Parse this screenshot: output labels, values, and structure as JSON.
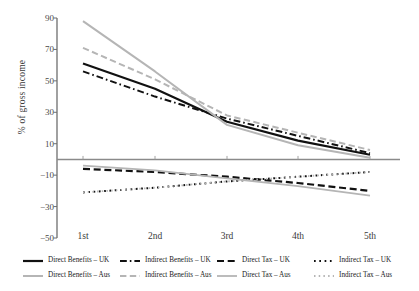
{
  "chart_data": {
    "type": "line",
    "title": "",
    "xlabel": "",
    "ylabel": "% of gross income",
    "categories": [
      "1st",
      "2nd",
      "3rd",
      "4th",
      "5th"
    ],
    "ylim": [
      -50,
      90
    ],
    "yticks": [
      90,
      70,
      50,
      30,
      10,
      -10,
      -30,
      -50
    ],
    "ytick_labels": [
      "90",
      "70",
      "50",
      "30",
      "10",
      "−10",
      "−30",
      "−50"
    ],
    "grid": false,
    "legend_position": "bottom",
    "zero_line": 0,
    "series": [
      {
        "name": "Direct Benefits – UK",
        "color": "#111111",
        "style": "solid",
        "width": 2.2,
        "values": [
          61,
          45,
          24,
          12,
          3
        ]
      },
      {
        "name": "Indirect Benefits – UK",
        "color": "#111111",
        "style": "dashdot",
        "width": 2.0,
        "values": [
          56,
          40,
          26,
          15,
          4
        ]
      },
      {
        "name": "Direct Tax – UK",
        "color": "#111111",
        "style": "dashed",
        "width": 2.2,
        "values": [
          -6,
          -8,
          -11,
          -15,
          -20
        ]
      },
      {
        "name": "Indirect Tax – UK",
        "color": "#111111",
        "style": "dotted",
        "width": 2.0,
        "values": [
          -21,
          -18,
          -14,
          -11,
          -8
        ]
      },
      {
        "name": "Direct Benefits – Aus",
        "color": "#b5b5b5",
        "style": "solid",
        "width": 2.0,
        "values": [
          88,
          56,
          22,
          9,
          1
        ]
      },
      {
        "name": "Indirect Benefits – Aus",
        "color": "#b5b5b5",
        "style": "dashed",
        "width": 2.0,
        "values": [
          71,
          51,
          28,
          17,
          6
        ]
      },
      {
        "name": "Direct Tax – Aus",
        "color": "#b5b5b5",
        "style": "solid",
        "width": 1.8,
        "values": [
          -4,
          -7,
          -12,
          -17,
          -23
        ]
      },
      {
        "name": "Indirect Tax – Aus",
        "color": "#b5b5b5",
        "style": "dotted",
        "width": 1.8,
        "values": [
          -21,
          -18,
          -14,
          -11,
          -8
        ]
      }
    ]
  },
  "axis": {
    "y_title": "% of gross income",
    "y_tick_labels": [
      "90",
      "70",
      "50",
      "30",
      "10",
      "−10",
      "−30",
      "−50"
    ],
    "x_tick_labels": [
      "1st",
      "2nd",
      "3rd",
      "4th",
      "5th"
    ]
  },
  "legend": {
    "row1": [
      "Direct Benefits – UK",
      "Indirect Benefits – UK",
      "Direct Tax – UK",
      "Indirect Tax – UK"
    ],
    "row2": [
      "Direct Benefits – Aus",
      "Indirect Benefits – Aus",
      "Direct Tax – Aus",
      "Indirect Tax – Aus"
    ]
  },
  "colors": {
    "uk": "#111111",
    "aus": "#b5b5b5",
    "axis": "#6e6e6e",
    "background": "#ffffff"
  }
}
